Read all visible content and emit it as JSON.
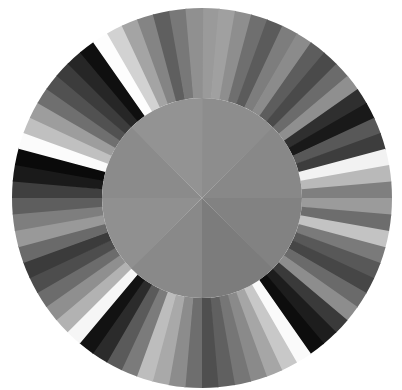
{
  "background_color": "#ffffff",
  "geometry": {
    "center_x": 202,
    "center_y": 198,
    "outer_radius": 190,
    "inner_radius": 100,
    "outer_segment_count": 72,
    "inner_sector_count": 8,
    "rotation_offset_deg": -90
  },
  "chart_data": {
    "type": "pie",
    "subtitle": "",
    "xlabel": "",
    "ylabel": "",
    "legend_position": "none",
    "grid": false,
    "series": [
      {
        "name": "outer-ring",
        "radius_inner": 100,
        "radius_outer": 190,
        "segment_count": 72,
        "segment_angle_deg": 5,
        "start_angle_deg": -90,
        "values": [
          5,
          5,
          5,
          5,
          5,
          5,
          5,
          5,
          5,
          5,
          5,
          5,
          5,
          5,
          5,
          5,
          5,
          5,
          5,
          5,
          5,
          5,
          5,
          5,
          5,
          5,
          5,
          5,
          5,
          5,
          5,
          5,
          5,
          5,
          5,
          5,
          5,
          5,
          5,
          5,
          5,
          5,
          5,
          5,
          5,
          5,
          5,
          5,
          5,
          5,
          5,
          5,
          5,
          5,
          5,
          5,
          5,
          5,
          5,
          5,
          5,
          5,
          5,
          5,
          5,
          5,
          5,
          5,
          5,
          5,
          5,
          5
        ],
        "colors": [
          "#9a9a9a",
          "#a0a0a0",
          "#8e8e8e",
          "#6f6f6f",
          "#5b5b5b",
          "#7d7d7d",
          "#8b8b8b",
          "#5d5d5d",
          "#4a4a4a",
          "#6b6b6b",
          "#8f8f8f",
          "#2f2f2f",
          "#191919",
          "#585858",
          "#3d3d3d",
          "#f2f2f2",
          "#b9b9b9",
          "#7f7f7f",
          "#9b9b9b",
          "#6d6d6d",
          "#c3c3c3",
          "#7a7a7a",
          "#585858",
          "#464646",
          "#6a6a6a",
          "#8d8d8d",
          "#3a3a3a",
          "#1d1d1d",
          "#0d0d0d",
          "#fafafa",
          "#c8c8c8",
          "#a6a6a6",
          "#8a8a8a",
          "#767676",
          "#606060",
          "#4f4f4f",
          "#6e6e6e",
          "#8c8c8c",
          "#a9a9a9",
          "#bdbdbd",
          "#7b7b7b",
          "#5a5a5a",
          "#2b2b2b",
          "#121212",
          "#f6f6f6",
          "#b2b2b2",
          "#8f8f8f",
          "#6c6c6c",
          "#4d4d4d",
          "#3b3b3b",
          "#6a6a6a",
          "#999999",
          "#7e7e7e",
          "#5e5e5e",
          "#3f3f3f",
          "#1a1a1a",
          "#0a0a0a",
          "#fbfbfb",
          "#c0c0c0",
          "#9d9d9d",
          "#6f6f6f",
          "#515151",
          "#3c3c3c",
          "#262626",
          "#0f0f0f",
          "#fdfdfd",
          "#d2d2d2",
          "#a4a4a4",
          "#848484",
          "#5f5f5f",
          "#787878",
          "#909090"
        ],
        "labels": [
          "seg-01",
          "seg-02",
          "seg-03",
          "seg-04",
          "seg-05",
          "seg-06",
          "seg-07",
          "seg-08",
          "seg-09",
          "seg-10",
          "seg-11",
          "seg-12",
          "seg-13",
          "seg-14",
          "seg-15",
          "seg-16",
          "seg-17",
          "seg-18",
          "seg-19",
          "seg-20",
          "seg-21",
          "seg-22",
          "seg-23",
          "seg-24",
          "seg-25",
          "seg-26",
          "seg-27",
          "seg-28",
          "seg-29",
          "seg-30",
          "seg-31",
          "seg-32",
          "seg-33",
          "seg-34",
          "seg-35",
          "seg-36",
          "seg-37",
          "seg-38",
          "seg-39",
          "seg-40",
          "seg-41",
          "seg-42",
          "seg-43",
          "seg-44",
          "seg-45",
          "seg-46",
          "seg-47",
          "seg-48",
          "seg-49",
          "seg-50",
          "seg-51",
          "seg-52",
          "seg-53",
          "seg-54",
          "seg-55",
          "seg-56",
          "seg-57",
          "seg-58",
          "seg-59",
          "seg-60",
          "seg-61",
          "seg-62",
          "seg-63",
          "seg-64",
          "seg-65",
          "seg-66",
          "seg-67",
          "seg-68",
          "seg-69",
          "seg-70",
          "seg-71",
          "seg-72"
        ]
      },
      {
        "name": "inner-disc",
        "radius_inner": 0,
        "radius_outer": 100,
        "segment_count": 8,
        "segment_angle_deg": 45,
        "start_angle_deg": -90,
        "values": [
          45,
          45,
          45,
          45,
          45,
          45,
          45,
          45
        ],
        "colors": [
          "#8d8d8d",
          "#888888",
          "#828282",
          "#7c7c7c",
          "#898989",
          "#909090",
          "#8b8b8b",
          "#939393"
        ],
        "labels": [
          "sector-1",
          "sector-2",
          "sector-3",
          "sector-4",
          "sector-5",
          "sector-6",
          "sector-7",
          "sector-8"
        ]
      }
    ]
  }
}
